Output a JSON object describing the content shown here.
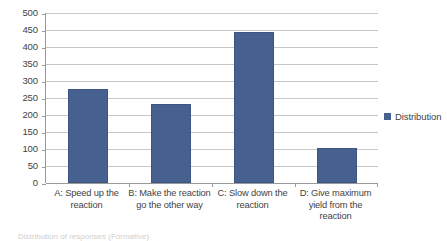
{
  "chart_data": {
    "type": "bar",
    "title": "",
    "xlabel": "",
    "ylabel": "",
    "ylim": [
      0,
      500
    ],
    "ytick_step": 50,
    "grid": true,
    "legend_position": "right",
    "categories": [
      "A: Speed up the reaction",
      "B: Make the reaction go the other way",
      "C: Slow down the reaction",
      "D: Give maximum yield from the reaction"
    ],
    "series": [
      {
        "name": "Distribution",
        "color": "#46618f",
        "values": [
          277,
          233,
          443,
          104
        ]
      }
    ],
    "ytick_labels": [
      "500",
      "450",
      "400",
      "350",
      "300",
      "250",
      "200",
      "150",
      "100",
      "50",
      "0"
    ]
  },
  "legend": {
    "entries": [
      {
        "label": "Distribution",
        "color": "#46618f"
      }
    ]
  },
  "caption": {
    "text": "Distribution of responses (Formative)"
  },
  "colors": {
    "bar": "#46618f",
    "bar_border": "#3d5580",
    "gridline": "#c8c8c8",
    "axis": "#9a9a9a",
    "text": "#3f3f3f"
  }
}
